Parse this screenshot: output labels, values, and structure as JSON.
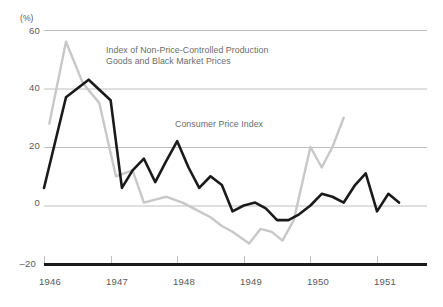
{
  "chart_data": {
    "type": "line",
    "title": "",
    "subtitle": "",
    "xlabel": "",
    "ylabel": "",
    "yunit": "(%)",
    "xlim": [
      1946.0,
      1951.75
    ],
    "ylim": [
      -20,
      60
    ],
    "yticks": [
      60,
      40,
      20,
      0,
      -20
    ],
    "ytick_labels": [
      "60",
      "40",
      "20",
      "0",
      "–20"
    ],
    "xticks": [
      1946,
      1947,
      1948,
      1949,
      1950,
      1951
    ],
    "xtick_labels": [
      "1946",
      "1947",
      "1948",
      "1949",
      "1950",
      "1951"
    ],
    "grid": "horizontal",
    "legend_position": "inline-annotations",
    "series": [
      {
        "name": "Index of Non-Price-Controlled Production Goods and Black Market Prices",
        "color": "#c8c8c8",
        "x": [
          1946.08,
          1946.33,
          1946.58,
          1946.83,
          1947.08,
          1947.33,
          1947.5,
          1947.67,
          1947.83,
          1948.08,
          1948.33,
          1948.5,
          1948.67,
          1948.83,
          1949.08,
          1949.25,
          1949.42,
          1949.58,
          1949.75,
          1950.0,
          1950.17,
          1950.33,
          1950.5
        ],
        "values": [
          28,
          56,
          42,
          35,
          10,
          12,
          1,
          2,
          3,
          1,
          -2,
          -4,
          -7,
          -9,
          -13,
          -8,
          -9,
          -12,
          -5,
          20,
          13,
          20,
          30
        ]
      },
      {
        "name": "Consumer Price Index",
        "color": "#1a1a1a",
        "x": [
          1946.0,
          1946.33,
          1946.67,
          1947.0,
          1947.17,
          1947.33,
          1947.5,
          1947.67,
          1947.83,
          1948.0,
          1948.17,
          1948.33,
          1948.5,
          1948.67,
          1948.83,
          1949.0,
          1949.17,
          1949.33,
          1949.5,
          1949.67,
          1949.83,
          1950.0,
          1950.17,
          1950.33,
          1950.5,
          1950.67,
          1950.83,
          1951.0,
          1951.17,
          1951.33
        ],
        "values": [
          6,
          37,
          43,
          36,
          6,
          12,
          16,
          8,
          15,
          22,
          13,
          6,
          10,
          7,
          -2,
          0,
          1,
          -1,
          -5,
          -5,
          -3,
          0,
          4,
          3,
          1,
          7,
          11,
          -2,
          4,
          1
        ]
      }
    ],
    "annotations": [
      {
        "id": "annot-noncontrolled",
        "line1": "Index of Non-Price-Controlled Production",
        "line2": "Goods and Black Market Prices"
      },
      {
        "id": "annot-cpi",
        "line1": "Consumer Price Index",
        "line2": ""
      }
    ],
    "colors": {
      "grid": "#bfbfbf",
      "axis": "#1a1a1a",
      "text": "#58595b",
      "series_black": "#1a1a1a",
      "series_gray": "#c8c8c8"
    }
  }
}
